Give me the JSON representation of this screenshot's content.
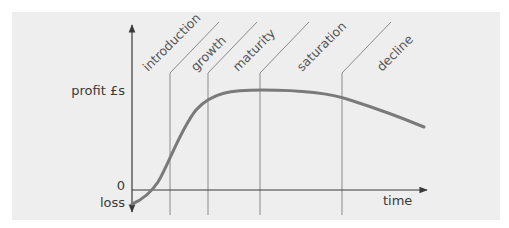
{
  "diagram": {
    "y_axis": {
      "label": "profit £s",
      "zero_label": "0",
      "negative_label": "loss"
    },
    "x_axis": {
      "label": "time"
    },
    "stages": [
      {
        "label": "introduction"
      },
      {
        "label": "growth"
      },
      {
        "label": "maturity"
      },
      {
        "label": "saturation"
      },
      {
        "label": "decline"
      }
    ],
    "colors": {
      "background": "#eeeeee",
      "curve": "#7a7a7a",
      "axis": "#3a3a3a",
      "divider": "#8a8a8a",
      "text": "#3a3a3a"
    }
  }
}
